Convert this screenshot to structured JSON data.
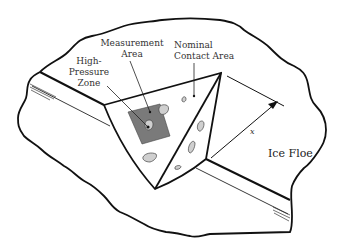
{
  "diagram": {
    "type": "schematic",
    "labels": {
      "measurement_area": [
        "Measurement",
        "Area"
      ],
      "nominal_contact_area": [
        "Nominal",
        "Contact Area"
      ],
      "high_pressure_zone": [
        "High-",
        "Pressure",
        "Zone"
      ],
      "ice_floe": "Ice Floe",
      "distance_symbol": "x"
    },
    "colors": {
      "outline": "#111111",
      "measurement_area_fill": "#7a7a7a",
      "contact_patch_fill": "#cfcfcf",
      "background": "#ffffff"
    }
  }
}
